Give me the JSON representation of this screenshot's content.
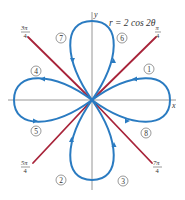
{
  "figure": {
    "equation": "r = 2 cos 2θ",
    "axes": {
      "x_label": "x",
      "y_label": "y"
    },
    "colors": {
      "curve": "#2a7bc1",
      "rays": "#a8243a",
      "axes": "#8a8a8a",
      "text": "#333333"
    },
    "rays": [
      {
        "angle_label_num": "π",
        "angle_label_den": "4",
        "angle": "π/4"
      },
      {
        "angle_label_num": "3π",
        "angle_label_den": "4",
        "angle": "3π/4"
      },
      {
        "angle_label_num": "5π",
        "angle_label_den": "4",
        "angle": "5π/4"
      },
      {
        "angle_label_num": "7π",
        "angle_label_den": "4",
        "angle": "7π/4"
      }
    ],
    "segments": [
      {
        "label": "1"
      },
      {
        "label": "2"
      },
      {
        "label": "3"
      },
      {
        "label": "4"
      },
      {
        "label": "5"
      },
      {
        "label": "6"
      },
      {
        "label": "7"
      },
      {
        "label": "8"
      }
    ]
  }
}
